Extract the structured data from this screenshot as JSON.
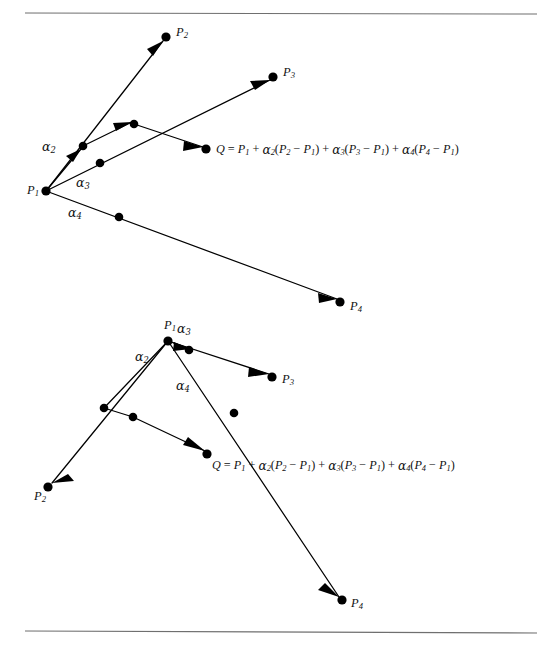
{
  "figure": {
    "background_color": "#ffffff",
    "ink_color": "#000000",
    "rule_color": "#6f6f6f",
    "rules": [
      {
        "name": "top-rule",
        "x1": 25,
        "y1": 13,
        "x2": 537,
        "y2": 14
      },
      {
        "name": "bottom-rule",
        "x1": 25,
        "y1": 631,
        "x2": 537,
        "y2": 633
      }
    ]
  },
  "labels": {
    "P": "P",
    "Q": "Q",
    "alpha": "α",
    "sub1": "1",
    "sub2": "2",
    "sub3": "3",
    "sub4": "4"
  },
  "formula": {
    "text": "Q = P1 + α2(P2 − P1) + α3(P3 − P1) + α4(P4 − P1)",
    "parts": {
      "lhs_var": "Q",
      "equals": " = ",
      "base": "P",
      "base_sub": "1",
      "plus": " + ",
      "minus": " − ",
      "open": "(",
      "close": ")",
      "coef": "α",
      "coef_subs": [
        "2",
        "3",
        "4"
      ],
      "point_subs": [
        "2",
        "3",
        "4"
      ]
    }
  },
  "diagrams": [
    {
      "id": "top-diagram",
      "name": "diagram-points-spread-right",
      "origin_label": "P1",
      "points": [
        {
          "name": "P1",
          "base": "P",
          "sub": "1",
          "x": 46,
          "y": 191,
          "label_x": 27,
          "label_y": 191
        },
        {
          "name": "P2",
          "base": "P",
          "sub": "2",
          "x": 166,
          "y": 37,
          "label_x": 176,
          "label_y": 33
        },
        {
          "name": "P3",
          "base": "P",
          "sub": "3",
          "x": 273,
          "y": 77,
          "label_x": 283,
          "label_y": 73
        },
        {
          "name": "P4",
          "base": "P",
          "sub": "4",
          "x": 340,
          "y": 302,
          "label_x": 350,
          "label_y": 307
        },
        {
          "name": "Q",
          "base": "Q",
          "sub": "",
          "x": 206,
          "y": 149,
          "label_x": 216,
          "label_y": 150
        }
      ],
      "intermediate_dots": [
        {
          "name": "alpha2-endpoint",
          "x": 83,
          "y": 146
        },
        {
          "name": "alpha3-endpoint",
          "x": 100,
          "y": 163
        },
        {
          "name": "alpha4-endpoint",
          "x": 119,
          "y": 217
        },
        {
          "name": "partial-sum-dot",
          "x": 134,
          "y": 124
        }
      ],
      "greek_labels": [
        {
          "name": "alpha2-label",
          "base": "α",
          "sub": "2",
          "x": 49,
          "y": 146
        },
        {
          "name": "alpha3-label",
          "base": "α",
          "sub": "3",
          "x": 82,
          "y": 182
        },
        {
          "name": "alpha4-label",
          "base": "α",
          "sub": "4",
          "x": 74,
          "y": 212
        }
      ],
      "formula_x": 216,
      "formula_y": 150
    },
    {
      "id": "bottom-diagram",
      "name": "diagram-points-spread-down",
      "origin_label": "P1",
      "points": [
        {
          "name": "P1",
          "base": "P",
          "sub": "1",
          "x": 168,
          "y": 341,
          "label_x": 164,
          "label_y": 326
        },
        {
          "name": "P2",
          "base": "P",
          "sub": "2",
          "x": 48,
          "y": 487,
          "label_x": 34,
          "label_y": 497
        },
        {
          "name": "P3",
          "base": "P",
          "sub": "3",
          "x": 272,
          "y": 377,
          "label_x": 282,
          "label_y": 380
        },
        {
          "name": "P4",
          "base": "P",
          "sub": "4",
          "x": 342,
          "y": 600,
          "label_x": 351,
          "label_y": 604
        },
        {
          "name": "Q",
          "base": "Q",
          "sub": "",
          "x": 207,
          "y": 454,
          "label_x": 212,
          "label_y": 466
        }
      ],
      "intermediate_dots": [
        {
          "name": "alpha2-endpoint",
          "x": 104,
          "y": 408
        },
        {
          "name": "alpha3-endpoint",
          "x": 189,
          "y": 350
        },
        {
          "name": "alpha4-endpoint",
          "x": 234,
          "y": 413
        },
        {
          "name": "partial-sum-dot",
          "x": 133,
          "y": 417
        }
      ],
      "greek_labels": [
        {
          "name": "alpha2-label",
          "base": "α",
          "sub": "2",
          "x": 141,
          "y": 356
        },
        {
          "name": "alpha3-label",
          "base": "α",
          "sub": "3",
          "x": 181,
          "y": 329
        },
        {
          "name": "alpha4-label",
          "base": "α",
          "sub": "4",
          "x": 181,
          "y": 385
        }
      ],
      "formula_x": 212,
      "formula_y": 466
    }
  ]
}
